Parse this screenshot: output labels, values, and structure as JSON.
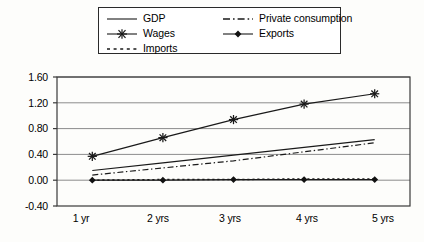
{
  "chart_data": {
    "type": "line",
    "title": "",
    "xlabel": "",
    "ylabel": "",
    "categories": [
      "1 yr",
      "2 yrs",
      "3 yrs",
      "4 yrs",
      "5 yrs"
    ],
    "ylim": [
      -0.4,
      1.6
    ],
    "yticks": [
      "-0.40",
      "0.00",
      "0.40",
      "0.80",
      "1.20",
      "1.60"
    ],
    "ytick_values": [
      -0.4,
      0.0,
      0.4,
      0.8,
      1.2,
      1.6
    ],
    "grid": true,
    "legend_position": "top",
    "series": [
      {
        "name": "GDP",
        "style": "solid",
        "marker": "none",
        "values": [
          0.15,
          0.27,
          0.39,
          0.51,
          0.63
        ]
      },
      {
        "name": "Wages",
        "style": "solid",
        "marker": "asterisk",
        "values": [
          0.37,
          0.66,
          0.94,
          1.18,
          1.34
        ]
      },
      {
        "name": "Imports",
        "style": "dotted",
        "marker": "none",
        "values": [
          0.0,
          0.01,
          0.01,
          0.02,
          0.02
        ]
      },
      {
        "name": "Private consumption",
        "style": "dash-dot",
        "marker": "none",
        "values": [
          0.08,
          0.19,
          0.3,
          0.44,
          0.58
        ]
      },
      {
        "name": "Exports",
        "style": "solid",
        "marker": "diamond",
        "values": [
          0.0,
          0.0,
          0.01,
          0.01,
          0.01
        ]
      }
    ]
  },
  "legend": {
    "items": [
      {
        "label": "GDP",
        "icon": "solid-line-swatch"
      },
      {
        "label": "Wages",
        "icon": "asterisk-line-swatch"
      },
      {
        "label": "Imports",
        "icon": "dotted-line-swatch"
      },
      {
        "label": "Private consumption",
        "icon": "dash-dot-line-swatch"
      },
      {
        "label": "Exports",
        "icon": "diamond-line-swatch"
      }
    ]
  },
  "axes": {
    "y_labels": [
      "1.60",
      "1.20",
      "0.80",
      "0.40",
      "0.00",
      "-0.40"
    ],
    "x_labels": [
      "1 yr",
      "2 yrs",
      "3 yrs",
      "4 yrs",
      "5 yrs"
    ]
  },
  "colors": {
    "line": "#1a1a1a",
    "grid": "#8c8c8c",
    "frame": "#3a3a3a",
    "background": "#fdfdfb"
  }
}
